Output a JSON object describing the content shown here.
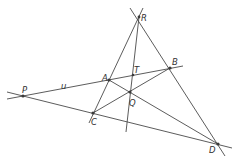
{
  "diagram": {
    "labels": {
      "R": "R",
      "B": "B",
      "A": "A",
      "T": "T",
      "Q": "Q",
      "C": "C",
      "P": "P",
      "D": "D",
      "u": "u"
    },
    "points": {
      "R": [
        139,
        17
      ],
      "B": [
        170,
        68
      ],
      "A": [
        109,
        80
      ],
      "T": [
        133,
        75
      ],
      "Q": [
        130,
        92
      ],
      "C": [
        93,
        113
      ],
      "P": [
        23,
        96
      ],
      "D": [
        218,
        144
      ]
    },
    "lines": [
      {
        "name": "line-RC",
        "from": [
          143,
          8
        ],
        "to": [
          89,
          123
        ]
      },
      {
        "name": "line-RD",
        "from": [
          130,
          8
        ],
        "to": [
          225,
          156
        ]
      },
      {
        "name": "line-u-PB",
        "from": [
          7,
          99
        ],
        "to": [
          183,
          66
        ]
      },
      {
        "name": "line-PD",
        "from": [
          7,
          92
        ],
        "to": [
          232,
          148
        ]
      },
      {
        "name": "line-RT",
        "from": [
          139,
          17
        ],
        "to": [
          126,
          132
        ]
      },
      {
        "name": "segment-AD",
        "from": [
          109,
          80
        ],
        "to": [
          218,
          144
        ]
      },
      {
        "name": "segment-CB",
        "from": [
          93,
          113
        ],
        "to": [
          170,
          68
        ]
      }
    ],
    "colors": {
      "line": "#4a4a4a",
      "point": "#3a3a3a",
      "label": "#333333"
    }
  }
}
